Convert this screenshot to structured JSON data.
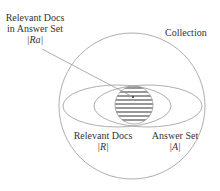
{
  "labels": {
    "relevant_in_answer_line1": "Relevant Docs",
    "relevant_in_answer_line2": "in Answer Set",
    "relevant_in_answer_symbol": "|Ra|",
    "collection": "Collection",
    "relevant_docs": "Relevant Docs",
    "relevant_symbol": "|R|",
    "answer_set": "Answer Set",
    "answer_symbol": "|A|"
  },
  "colors": {
    "stroke": "#999999",
    "hatch": "#333333",
    "text": "#333333"
  }
}
